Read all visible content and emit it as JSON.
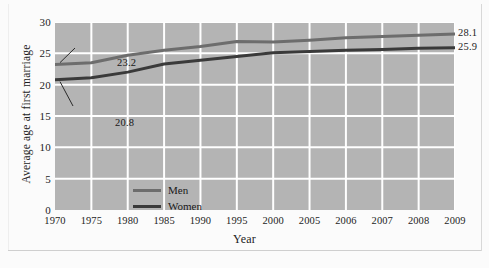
{
  "chart_data": {
    "type": "line",
    "title": "",
    "xlabel": "Year",
    "ylabel": "Average age at first marriage",
    "categories": [
      "1970",
      "1975",
      "1980",
      "1985",
      "1990",
      "1995",
      "2000",
      "2005",
      "2006",
      "2007",
      "2008",
      "2009"
    ],
    "ylim": [
      0,
      30
    ],
    "yticks": [
      "0",
      "5",
      "10",
      "15",
      "20",
      "25",
      "30"
    ],
    "grid": true,
    "legend_position": "inside-lower-left",
    "series": [
      {
        "name": "Men",
        "color": "#6d6d6d",
        "values": [
          23.2,
          23.5,
          24.7,
          25.5,
          26.1,
          26.9,
          26.8,
          27.1,
          27.5,
          27.7,
          27.9,
          28.1
        ],
        "start_label": "23.2",
        "end_label": "28.1"
      },
      {
        "name": "Women",
        "color": "#3a3a3a",
        "values": [
          20.8,
          21.1,
          22.0,
          23.3,
          23.9,
          24.5,
          25.1,
          25.3,
          25.5,
          25.6,
          25.8,
          25.9
        ],
        "start_label": "20.8",
        "end_label": "25.9"
      }
    ],
    "annotations": [
      {
        "text": "23.2",
        "series": "Men",
        "x": "1970"
      },
      {
        "text": "20.8",
        "series": "Women",
        "x": "1970"
      },
      {
        "text": "28.1",
        "series": "Men",
        "x": "2009"
      },
      {
        "text": "25.9",
        "series": "Women",
        "x": "2009"
      }
    ],
    "colors": {
      "plot_background": "#b4b4b4",
      "gridline": "#ffffff",
      "figure_background": "#fbfbfb",
      "men_line": "#6d6d6d",
      "women_line": "#3a3a3a",
      "text": "#1d1d1d"
    }
  }
}
